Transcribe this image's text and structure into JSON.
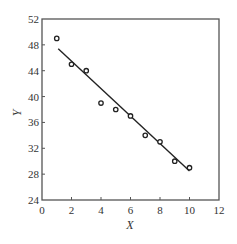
{
  "chart_data": {
    "type": "scatter",
    "title": "",
    "xlabel": "X",
    "ylabel": "Y",
    "xlim": [
      0,
      12
    ],
    "ylim": [
      24,
      52
    ],
    "x_ticks": [
      0,
      2,
      4,
      6,
      8,
      10,
      12
    ],
    "y_ticks": [
      24,
      28,
      32,
      36,
      40,
      44,
      48,
      52
    ],
    "grid": false,
    "legend": null,
    "series": [
      {
        "name": "observations",
        "marker": "open-circle",
        "x": [
          1,
          2,
          3,
          4,
          5,
          6,
          7,
          8,
          9,
          10
        ],
        "y": [
          49,
          45,
          44,
          39,
          38,
          37,
          34,
          33,
          30,
          29
        ]
      },
      {
        "name": "fitted-line",
        "style": "line",
        "x": [
          1.1,
          10
        ],
        "y": [
          47.4,
          28.5
        ]
      }
    ]
  },
  "colors": {
    "axis": "#555555",
    "marker": "#222222",
    "line": "#222222"
  }
}
